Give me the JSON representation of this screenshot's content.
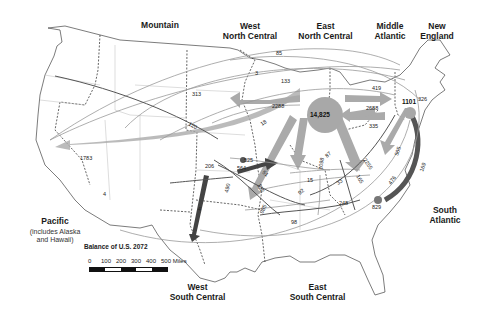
{
  "regions": {
    "mountain": "Mountain",
    "west_north_central": "West\nNorth Central",
    "east_north_central": "East\nNorth Central",
    "middle_atlantic": "Middle\nAtlantic",
    "new_england": "New\nEngland",
    "pacific": "Pacific",
    "pacific_note": "(includes Alaska\nand Hawaii)",
    "west_south_central": "West\nSouth Central",
    "east_south_central": "East\nSouth Central",
    "south_atlantic": "South\nAtlantic"
  },
  "balance": "Balance of U.S. 2072",
  "scale": {
    "ticks": [
      "0",
      "100",
      "200",
      "300",
      "400",
      "500 Miles"
    ]
  },
  "hubs": {
    "east_north_central": "14,825",
    "middle_atlantic": "1101",
    "west_south_central": "564",
    "south_atlantic": "829"
  },
  "flows": {
    "enc_to_pacific": "1783",
    "enc_to_wnc": "2288",
    "enc_to_ma": "2688",
    "ma_to_ne": "326",
    "ma_to_enc": "335",
    "enc_to_sa": "2255",
    "enc_to_esc": "1098",
    "enc_to_wsc": "985",
    "ma_to_sa": "505",
    "ma_to_sa_big": "476",
    "ne_to_sa": "169",
    "wnc_to_enc": "525",
    "wsc_to_pacific": "206",
    "wsc_to_mountain": "490",
    "mountain_line_1": "313",
    "mountain_line_2": "120",
    "line_3": "3",
    "line_85": "85",
    "line_133": "133",
    "line_419": "419",
    "line_18": "18",
    "line_4a": "4",
    "line_4b": "4",
    "line_51": "51",
    "line_122": "122",
    "line_15": "15",
    "line_92": "92",
    "line_87": "87",
    "line_33": "33",
    "line_165": "165",
    "line_248": "248",
    "line_98": "98",
    "line_95": "95"
  }
}
